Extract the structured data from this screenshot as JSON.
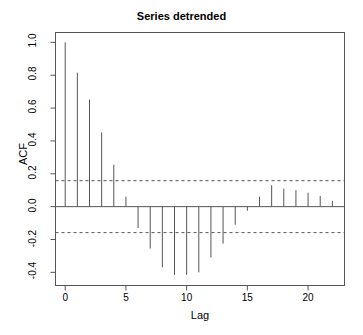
{
  "chart_data": {
    "type": "bar",
    "title": "Series detrended",
    "xlabel": "Lag",
    "ylabel": "ACF",
    "xlim": [
      -0.8,
      23.0
    ],
    "ylim": [
      -0.48,
      1.06
    ],
    "grid": false,
    "legend": "none",
    "x": [
      0,
      1,
      2,
      3,
      4,
      5,
      6,
      7,
      8,
      9,
      10,
      11,
      12,
      13,
      14,
      15,
      16,
      17,
      18,
      19,
      20,
      21,
      22
    ],
    "values": [
      1.0,
      0.815,
      0.652,
      0.452,
      0.255,
      0.06,
      -0.13,
      -0.255,
      -0.37,
      -0.415,
      -0.415,
      -0.4,
      -0.31,
      -0.225,
      -0.11,
      -0.025,
      0.06,
      0.13,
      0.11,
      0.1,
      0.085,
      0.065,
      0.035
    ],
    "xticks": [
      0,
      5,
      10,
      15,
      20
    ],
    "xtick_labels": [
      "0",
      "5",
      "10",
      "15",
      "20"
    ],
    "yticks": [
      -0.4,
      -0.2,
      0.0,
      0.2,
      0.4,
      0.6,
      0.8,
      1.0
    ],
    "ytick_labels": [
      "-0.4",
      "-0.2",
      "0.0",
      "0.2",
      "0.4",
      "0.6",
      "0.8",
      "1.0"
    ],
    "annotations": [
      {
        "name": "upper-confidence-bound",
        "value": 0.158,
        "style": "dashed"
      },
      {
        "name": "lower-confidence-bound",
        "value": -0.158,
        "style": "dashed"
      },
      {
        "name": "zero-line",
        "value": 0.0,
        "style": "solid"
      }
    ],
    "colors": {
      "line": "#555555",
      "axis": "#555555",
      "background": "#ffffff",
      "text": "#000000"
    }
  }
}
